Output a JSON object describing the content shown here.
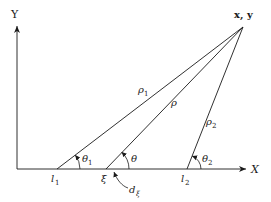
{
  "diagram": {
    "axes": {
      "x_label": "X",
      "y_label": "Y"
    },
    "point": {
      "label": "x, y"
    },
    "lines": [
      {
        "name": "rho1",
        "label": "ρ",
        "sub": "1"
      },
      {
        "name": "rho",
        "label": "ρ",
        "sub": ""
      },
      {
        "name": "rho2",
        "label": "ρ",
        "sub": "2"
      }
    ],
    "base_points": {
      "l1": {
        "label": "l",
        "sub": "1"
      },
      "xi": {
        "label": "ξ"
      },
      "l2": {
        "label": "l",
        "sub": "2"
      }
    },
    "angles": {
      "theta1": {
        "label": "θ",
        "sub": "1"
      },
      "theta": {
        "label": "θ",
        "sub": ""
      },
      "theta2": {
        "label": "θ",
        "sub": "2"
      }
    },
    "differential": {
      "label": "d",
      "sub": "ξ"
    },
    "colors": {
      "stroke": "#1a1a1a",
      "background": "#ffffff"
    }
  }
}
